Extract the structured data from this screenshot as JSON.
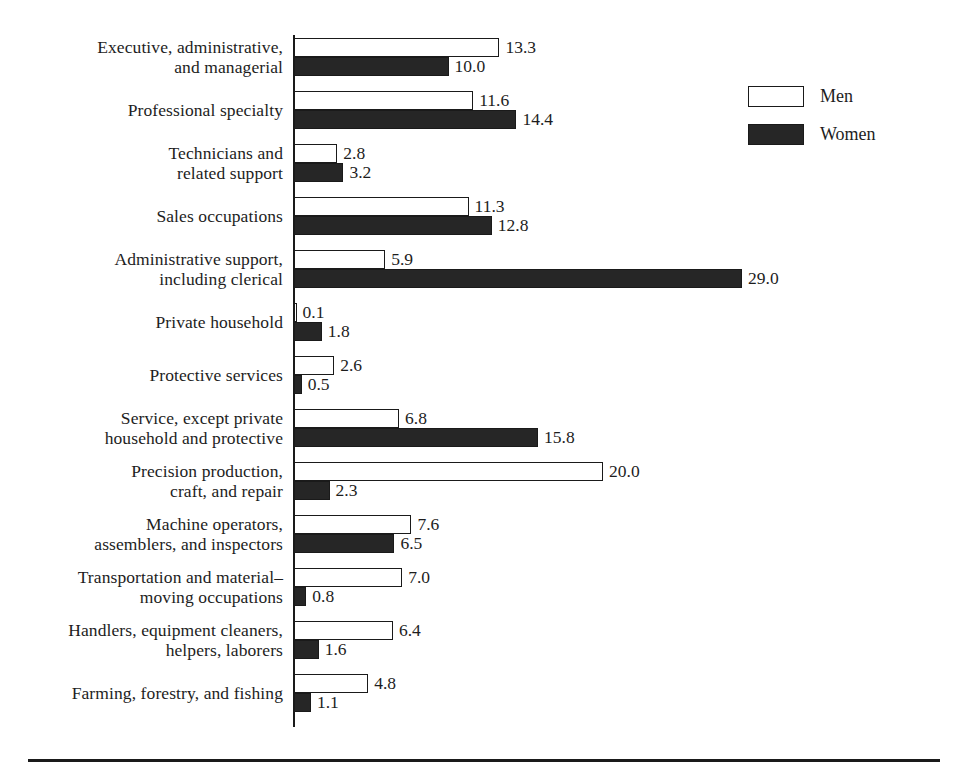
{
  "chart_data": {
    "type": "bar",
    "orientation": "horizontal",
    "title": "",
    "subtitle": "",
    "xlabel": "",
    "ylabel": "",
    "grid": false,
    "xlim": [
      0,
      29.0
    ],
    "axis_visible": "left-spine-only",
    "legend": {
      "position": "top-right",
      "entries": [
        {
          "name": "Men",
          "swatch": "white-outlined"
        },
        {
          "name": "Women",
          "swatch": "black-filled"
        }
      ]
    },
    "categories": [
      "Executive, administrative,\nand managerial",
      "Professional specialty",
      "Technicians and\nrelated support",
      "Sales occupations",
      "Administrative support,\nincluding clerical",
      "Private household",
      "Protective services",
      "Service, except private\nhousehold and protective",
      "Precision production,\ncraft, and repair",
      "Machine operators,\nassemblers, and inspectors",
      "Transportation and material–\nmoving occupations",
      "Handlers, equipment cleaners,\nhelpers, laborers",
      "Farming, forestry, and fishing"
    ],
    "series": [
      {
        "name": "Men",
        "color": "#ffffff",
        "values": [
          13.3,
          11.6,
          2.8,
          11.3,
          5.9,
          0.1,
          2.6,
          6.8,
          20.0,
          7.6,
          7.0,
          6.4,
          4.8
        ],
        "labels": [
          "13.3",
          "11.6",
          "2.8",
          "11.3",
          "5.9",
          "0.1",
          "2.6",
          "6.8",
          "20.0",
          "7.6",
          "7.0",
          "6.4",
          "4.8"
        ]
      },
      {
        "name": "Women",
        "color": "#262626",
        "values": [
          10.0,
          14.4,
          3.2,
          12.8,
          29.0,
          1.8,
          0.5,
          15.8,
          2.3,
          6.5,
          0.8,
          1.6,
          1.1
        ],
        "labels": [
          "10.0",
          "14.4",
          "3.2",
          "12.8",
          "29.0",
          "1.8",
          "0.5",
          "15.8",
          "2.3",
          "6.5",
          "0.8",
          "1.6",
          "1.1"
        ]
      }
    ]
  },
  "colors": {
    "men_fill": "#ffffff",
    "women_fill": "#262626",
    "stroke": "#1a1a1a",
    "text": "#1d1d1d",
    "background": "#ffffff"
  }
}
